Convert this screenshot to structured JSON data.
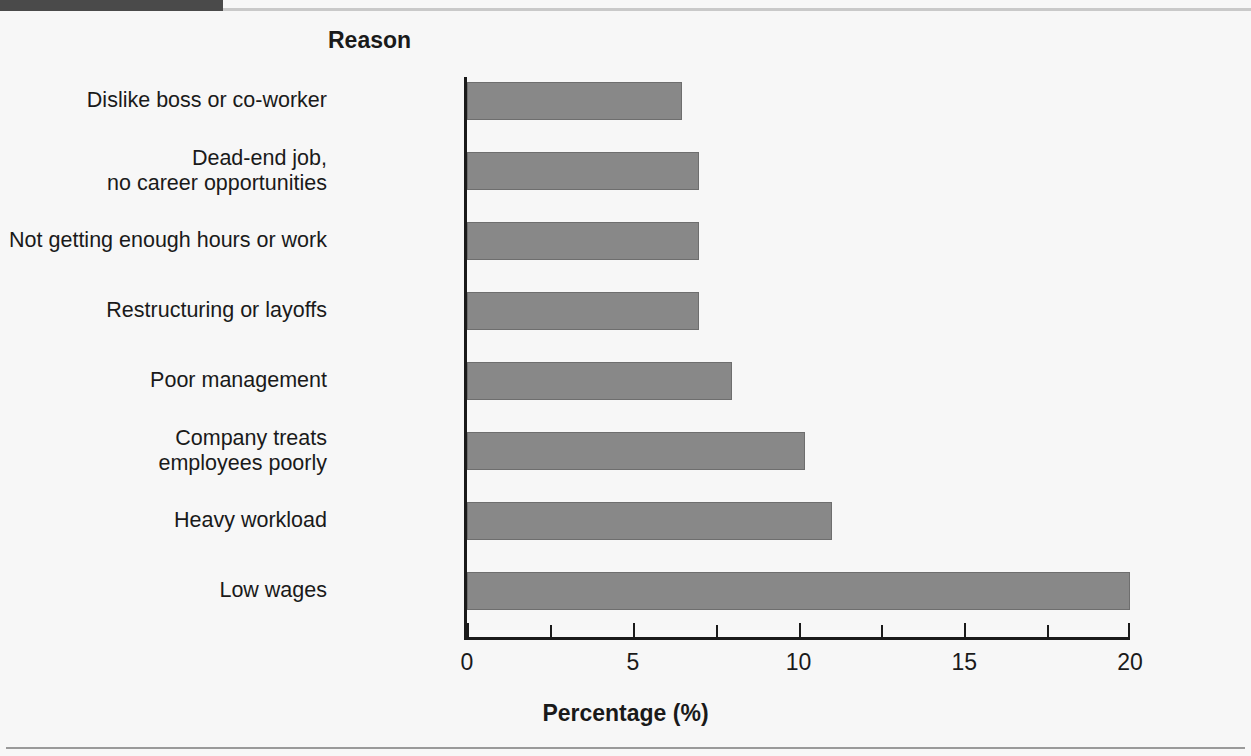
{
  "figure": {
    "background_color": "#f7f7f7",
    "marker_color": "#4a4a4a",
    "bar_color": "#888888",
    "bar_edge_color": "#6e6e6e",
    "axis_color": "#1a1a1a"
  },
  "chart_data": {
    "type": "bar",
    "orientation": "horizontal",
    "title": "",
    "xlabel": "Percentage (%)",
    "ylabel": "Reason",
    "xlim": [
      0,
      20
    ],
    "xticks": [
      0,
      5,
      10,
      15,
      20
    ],
    "xticklabels": [
      "0",
      "5",
      "10",
      "15",
      "20"
    ],
    "minor_tick_interval": 2.5,
    "grid": false,
    "legend": false,
    "categories": [
      "Dislike boss or co-worker",
      "Dead-end job,\nno career opportunities",
      "Not getting enough hours or work",
      "Restructuring or layoffs",
      "Poor management",
      "Company treats\nemployees poorly",
      "Heavy workload",
      "Low wages"
    ],
    "values": [
      6.5,
      7,
      7,
      7,
      8,
      10.2,
      11,
      20
    ]
  }
}
